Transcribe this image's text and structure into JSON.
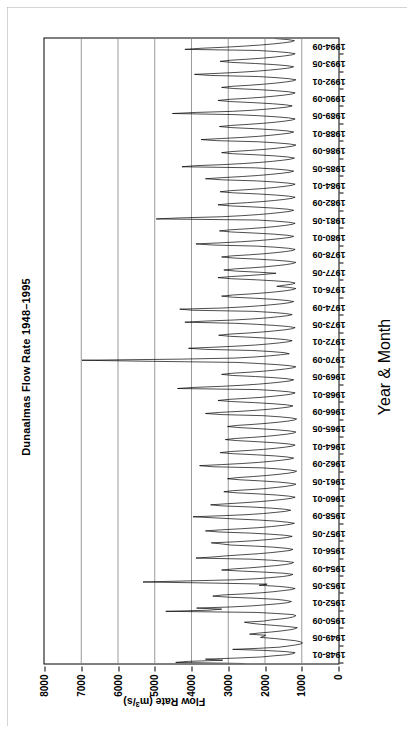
{
  "chart_data": {
    "type": "line",
    "title": "Dunaalmas Flow Rate 1948–1995",
    "xlabel": "Year & Month",
    "ylabel": "Flow Rate (m3/s)",
    "ylabel_parts": {
      "prefix": "Flow Rate (m",
      "sup": "3",
      "suffix": "/s)"
    },
    "grid": true,
    "grid_axis": "y",
    "legend": "none",
    "line_color": "#000000",
    "line_width": 0.7,
    "ylim": [
      0,
      8000
    ],
    "yticks": [
      0,
      1000,
      2000,
      3000,
      4000,
      5000,
      6000,
      7000,
      8000
    ],
    "ytick_labels": [
      "0",
      "1000",
      "2000",
      "3000",
      "4000",
      "5000",
      "6000",
      "7000",
      "8000"
    ],
    "x_start": "1948-01",
    "x_end": "1995-12",
    "x_count": 576,
    "xtick_labels": [
      "1948-01",
      "1949-05",
      "1950-09",
      "1952-01",
      "1953-05",
      "1954-09",
      "1956-01",
      "1957-05",
      "1958-09",
      "1960-01",
      "1961-05",
      "1962-09",
      "1964-01",
      "1965-05",
      "1966-09",
      "1968-01",
      "1969-05",
      "1970-09",
      "1972-01",
      "1973-05",
      "1974-09",
      "1976-01",
      "1977-05",
      "1978-09",
      "1980-01",
      "1981-05",
      "1982-09",
      "1984-01",
      "1985-05",
      "1986-09",
      "1988-01",
      "1989-05",
      "1990-09",
      "1992-01",
      "1993-05",
      "1994-09"
    ],
    "xtick_interval_months": 16,
    "values": [
      2560,
      4430,
      4080,
      3150,
      3620,
      2780,
      2100,
      1780,
      1420,
      1240,
      1180,
      1460,
      1990,
      2880,
      2150,
      1620,
      1380,
      1180,
      1020,
      980,
      1040,
      1180,
      1460,
      1740,
      2120,
      2040,
      1980,
      2420,
      2180,
      1820,
      1540,
      1320,
      1180,
      1120,
      1380,
      1720,
      2100,
      2380,
      2560,
      2040,
      1860,
      1560,
      1340,
      1220,
      1160,
      1240,
      1680,
      2240,
      4700,
      3560,
      3180,
      3860,
      2940,
      2360,
      1980,
      1620,
      1380,
      1280,
      1420,
      1680,
      2240,
      2980,
      3420,
      3180,
      2580,
      2120,
      1780,
      1520,
      1280,
      1180,
      1340,
      1640,
      2160,
      1940,
      3420,
      5320,
      4060,
      2820,
      2240,
      1860,
      1520,
      1320,
      1240,
      1480,
      1980,
      2620,
      3180,
      2860,
      2420,
      2060,
      1720,
      1460,
      1280,
      1220,
      1440,
      1820,
      2380,
      3880,
      3420,
      3060,
      2640,
      2180,
      1840,
      1560,
      1320,
      1240,
      1420,
      1760,
      2260,
      2940,
      3180,
      3460,
      2780,
      2280,
      1920,
      1620,
      1380,
      1260,
      1460,
      1880,
      2420,
      3260,
      3620,
      3180,
      2640,
      2160,
      1820,
      1540,
      1320,
      1200,
      1380,
      1700,
      2180,
      2820,
      3380,
      3960,
      3120,
      2460,
      2040,
      1720,
      1440,
      1300,
      1480,
      1860,
      2380,
      3180,
      3480,
      3020,
      2540,
      2120,
      1780,
      1500,
      1280,
      1180,
      1360,
      1680,
      2160,
      2760,
      3120,
      2880,
      2380,
      1980,
      1680,
      1420,
      1240,
      1160,
      1340,
      1660,
      2120,
      2680,
      3020,
      2760,
      2320,
      1940,
      1640,
      1380,
      1200,
      1140,
      1320,
      1640,
      2080,
      3420,
      3780,
      3180,
      2620,
      2180,
      1840,
      1560,
      1320,
      1220,
      1400,
      1740,
      2240,
      2860,
      3220,
      2940,
      2460,
      2040,
      1720,
      1460,
      1260,
      1180,
      1360,
      1700,
      2180,
      2740,
      3080,
      2820,
      2360,
      1960,
      1660,
      1400,
      1220,
      1160,
      1340,
      1680,
      2140,
      2680,
      3020,
      2780,
      2320,
      1940,
      1640,
      1380,
      1200,
      1140,
      1300,
      1620,
      2060,
      3180,
      3620,
      3240,
      2680,
      2220,
      1860,
      1580,
      1340,
      1240,
      1420,
      1780,
      2280,
      2920,
      3280,
      2980,
      2480,
      2060,
      1740,
      1460,
      1260,
      1180,
      1360,
      1720,
      2200,
      4380,
      3940,
      3180,
      2620,
      2180,
      1840,
      1560,
      1320,
      1220,
      1400,
      1760,
      2260,
      2880,
      3180,
      2900,
      2420,
      2020,
      1700,
      1440,
      1240,
      1160,
      1340,
      1680,
      2180,
      2760,
      5060,
      6980,
      4320,
      2820,
      2280,
      1880,
      1580,
      1340,
      1480,
      1840,
      2360,
      3620,
      4080,
      3380,
      2760,
      2260,
      1900,
      1600,
      1360,
      1260,
      1440,
      1800,
      2300,
      2940,
      3260,
      2980,
      2480,
      2060,
      1740,
      1460,
      1260,
      1180,
      1360,
      1720,
      2200,
      2820,
      4180,
      3640,
      2860,
      2340,
      1940,
      1640,
      1380,
      1260,
      1440,
      1800,
      2320,
      3980,
      4320,
      3180,
      2620,
      2180,
      1840,
      1540,
      1320,
      1220,
      1400,
      1760,
      2260,
      2880,
      3180,
      2880,
      2400,
      2000,
      1680,
      1420,
      1240,
      1160,
      1340,
      1680,
      1480,
      1260,
      1180,
      1320,
      1720,
      2240,
      2920,
      3280,
      2920,
      2420,
      2020,
      1700,
      2180,
      2780,
      3120,
      2840,
      2380,
      1980,
      1680,
      1420,
      1240,
      1160,
      1340,
      1700,
      2200,
      2840,
      3180,
      2900,
      2420,
      2020,
      1700,
      1440,
      1240,
      1180,
      1360,
      1720,
      2220,
      3420,
      3880,
      3220,
      2660,
      2200,
      1860,
      1560,
      1320,
      1220,
      1400,
      1760,
      2280,
      2920,
      3240,
      2940,
      2460,
      2040,
      1720,
      1460,
      1260,
      1180,
      1360,
      1720,
      2200,
      4960,
      4280,
      3180,
      2620,
      2180,
      1840,
      1560,
      1320,
      1220,
      1400,
      1780,
      2300,
      2940,
      3280,
      2980,
      2480,
      2060,
      1740,
      1460,
      1260,
      1180,
      1360,
      1720,
      2200,
      2860,
      3220,
      2940,
      2460,
      2040,
      1720,
      1460,
      1260,
      1180,
      1380,
      1740,
      2240,
      3180,
      3620,
      3160,
      2620,
      2180,
      1840,
      1540,
      1320,
      1220,
      1400,
      1760,
      2260,
      4260,
      3880,
      3120,
      2580,
      2140,
      1800,
      1520,
      1300,
      1200,
      1380,
      1740,
      2240,
      2880,
      3180,
      2900,
      2420,
      2020,
      1700,
      1440,
      1240,
      1160,
      1340,
      1700,
      2180,
      3320,
      3740,
      3180,
      2620,
      2180,
      1840,
      1560,
      1320,
      1220,
      1400,
      1760,
      2260,
      2900,
      3240,
      2940,
      2460,
      2040,
      1720,
      1460,
      1260,
      1180,
      1360,
      1720,
      2200,
      2840,
      4520,
      3860,
      2880,
      2340,
      1960,
      1640,
      1380,
      1260,
      1440,
      1800,
      2320,
      2960,
      3280,
      2980,
      2480,
      2060,
      1740,
      1460,
      1260,
      1180,
      1360,
      1720,
      2200,
      2860,
      3180,
      2900,
      2420,
      2020,
      1700,
      1440,
      1240,
      1160,
      1340,
      1700,
      2180,
      3480,
      3920,
      3240,
      2660,
      2200,
      1860,
      1560,
      1320,
      1220,
      1400,
      1760,
      2260,
      2900,
      3220,
      2940,
      2460,
      2040,
      1720,
      1460,
      1260,
      1180,
      1360,
      1720,
      2200,
      4180,
      3740,
      3080,
      2560,
      2120,
      1780,
      1500,
      1280,
      1200,
      1380,
      1740
    ]
  }
}
